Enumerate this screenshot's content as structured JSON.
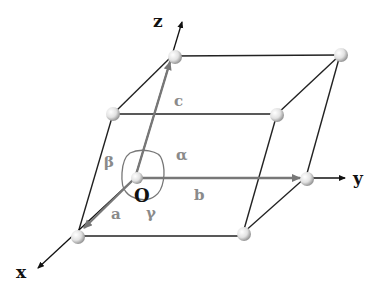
{
  "diagram": {
    "axes": [
      {
        "name": "x",
        "label": "x"
      },
      {
        "name": "y",
        "label": "y"
      },
      {
        "name": "z",
        "label": "z"
      }
    ],
    "origin_label": "O",
    "vectors": {
      "a": "a",
      "b": "b",
      "c": "c"
    },
    "angles": {
      "alpha": "α",
      "beta": "β",
      "gamma": "γ"
    },
    "colors": {
      "edge": "#222222",
      "vector": "#777777",
      "label_muted": "#8a8a8a",
      "atom": "#d8d8d8"
    },
    "atom_count": 8
  }
}
